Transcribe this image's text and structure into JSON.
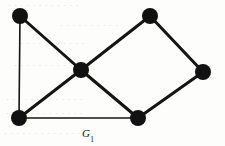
{
  "figure": {
    "name": "undirected-graph-figure",
    "label_main": "G",
    "label_subscript": "1",
    "background_color": "#fdfdfc",
    "ink_color": "#111111",
    "width": 225,
    "height": 146
  },
  "chart_data": {
    "type": "diagram",
    "diagram_kind": "undirected-graph",
    "title": "G1",
    "vertex_count": 6,
    "edge_count": 8,
    "vertex_radius": 8,
    "vertices": [
      {
        "id": "v1",
        "name": "top-left-vertex",
        "x": 20,
        "y": 16,
        "degree": 2
      },
      {
        "id": "v2",
        "name": "top-right-vertex",
        "x": 150,
        "y": 16,
        "degree": 2
      },
      {
        "id": "v3",
        "name": "center-vertex",
        "x": 81,
        "y": 70,
        "degree": 4
      },
      {
        "id": "v4",
        "name": "right-vertex",
        "x": 203,
        "y": 72,
        "degree": 2
      },
      {
        "id": "v5",
        "name": "bottom-left-vertex",
        "x": 19,
        "y": 118,
        "degree": 3
      },
      {
        "id": "v6",
        "name": "bottom-right-vertex",
        "x": 138,
        "y": 118,
        "degree": 3
      }
    ],
    "edges": [
      {
        "name": "edge-top-left-to-center",
        "from": "v1",
        "to": "v3",
        "width": 3.0
      },
      {
        "name": "edge-top-left-to-bottom-left",
        "from": "v1",
        "to": "v5",
        "width": 1.6
      },
      {
        "name": "edge-center-to-top-right",
        "from": "v3",
        "to": "v2",
        "width": 3.0
      },
      {
        "name": "edge-center-to-bottom-left",
        "from": "v3",
        "to": "v5",
        "width": 3.0
      },
      {
        "name": "edge-center-to-bottom-right",
        "from": "v3",
        "to": "v6",
        "width": 3.0
      },
      {
        "name": "edge-top-right-to-right",
        "from": "v2",
        "to": "v4",
        "width": 3.0
      },
      {
        "name": "edge-right-to-bottom-right",
        "from": "v4",
        "to": "v6",
        "width": 3.0
      },
      {
        "name": "edge-bottom-left-to-bottom-right",
        "from": "v5",
        "to": "v6",
        "width": 1.6
      }
    ],
    "label": {
      "text": "G1",
      "x": 88,
      "y": 134
    }
  },
  "ghost_marks": [
    {
      "name": "ghost-line-1",
      "text": "",
      "x": 8,
      "y": 2,
      "width": 210
    },
    {
      "name": "ghost-line-2",
      "text": "",
      "x": 18,
      "y": 22,
      "width": 190
    },
    {
      "name": "ghost-line-3",
      "text": "",
      "x": 10,
      "y": 40,
      "width": 200
    },
    {
      "name": "ghost-line-4",
      "text": "",
      "x": 12,
      "y": 62,
      "width": 205
    },
    {
      "name": "ghost-line-5",
      "text": "",
      "x": 6,
      "y": 96,
      "width": 212
    },
    {
      "name": "ghost-line-6",
      "text": "",
      "x": 6,
      "y": 110,
      "width": 212
    },
    {
      "name": "ghost-line-7",
      "text": "",
      "x": 4,
      "y": 130,
      "width": 214
    }
  ]
}
